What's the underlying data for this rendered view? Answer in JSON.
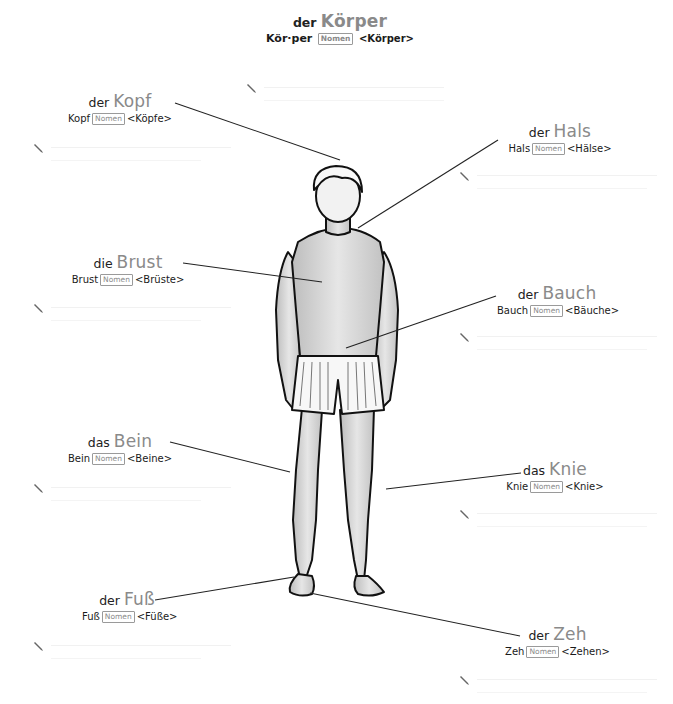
{
  "title": {
    "article": "der",
    "noun": "Körper",
    "hyphenation": "Kör·per",
    "badge": "Nomen",
    "plural": "<Körper>"
  },
  "labels": [
    {
      "id": "kopf",
      "article": "der",
      "noun": "Kopf",
      "word": "Kopf",
      "badge": "Nomen",
      "plural": "<Köpfe>"
    },
    {
      "id": "hals",
      "article": "der",
      "noun": "Hals",
      "word": "Hals",
      "badge": "Nomen",
      "plural": "<Hälse>"
    },
    {
      "id": "brust",
      "article": "die",
      "noun": "Brust",
      "word": "Brust",
      "badge": "Nomen",
      "plural": "<Brüste>"
    },
    {
      "id": "bauch",
      "article": "der",
      "noun": "Bauch",
      "word": "Bauch",
      "badge": "Nomen",
      "plural": "<Bäuche>"
    },
    {
      "id": "bein",
      "article": "das",
      "noun": "Bein",
      "word": "Bein",
      "badge": "Nomen",
      "plural": "<Beine>"
    },
    {
      "id": "knie",
      "article": "das",
      "noun": "Knie",
      "word": "Knie",
      "badge": "Nomen",
      "plural": "<Knie>"
    },
    {
      "id": "fuss",
      "article": "der",
      "noun": "Fuß",
      "word": "Fuß",
      "badge": "Nomen",
      "plural": "<Füße>"
    },
    {
      "id": "zeh",
      "article": "der",
      "noun": "Zeh",
      "word": "Zeh",
      "badge": "Nomen",
      "plural": "<Zehen>"
    }
  ],
  "icons": {
    "note": "pencil-icon"
  },
  "colors": {
    "noun_gray": "#8a8a8a",
    "text": "#1a1a1a",
    "line": "#222222",
    "note_rule": "#f1f1f1"
  }
}
